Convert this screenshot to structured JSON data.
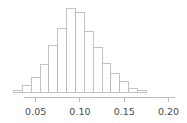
{
  "chart_data": {
    "type": "bar",
    "subtype": "histogram",
    "title": "",
    "subtitle": "",
    "xlabel": "",
    "ylabel": "",
    "xlim": [
      0.021,
      0.213
    ],
    "ylim": [
      0,
      1.0
    ],
    "grid": false,
    "legend": null,
    "bin_width": 0.01,
    "axis_line_range": [
      0.037,
      0.207
    ],
    "xticks": [
      0.05,
      0.1,
      0.15,
      0.2
    ],
    "xtick_labels": [
      "0.05",
      "0.10",
      "0.15",
      "0.20"
    ],
    "bin_edges": [
      0.025,
      0.035,
      0.045,
      0.055,
      0.065,
      0.075,
      0.085,
      0.095,
      0.105,
      0.115,
      0.125,
      0.135,
      0.145,
      0.155,
      0.165,
      0.175
    ],
    "bin_centers": [
      0.03,
      0.04,
      0.05,
      0.06,
      0.07,
      0.08,
      0.09,
      0.1,
      0.11,
      0.12,
      0.13,
      0.14,
      0.15,
      0.16,
      0.17
    ],
    "values": [
      0.02,
      0.07,
      0.17,
      0.32,
      0.54,
      0.74,
      0.97,
      0.93,
      0.7,
      0.52,
      0.33,
      0.22,
      0.12,
      0.04,
      0.02
    ],
    "bar_fill_color": "#ffffff",
    "bar_edge_color": "#b9b9b9",
    "axis_color": "#b5b5b5",
    "tick_label_color": "#4a4a4a",
    "background_color": "#ffffff"
  },
  "layout": {
    "plot_left_px": 10,
    "plot_right_px": 180,
    "baseline_y_px": 92,
    "plot_top_px": 6,
    "axis_y_px": 97,
    "tick_len_px": 4,
    "tick_label_y_px": 115
  }
}
